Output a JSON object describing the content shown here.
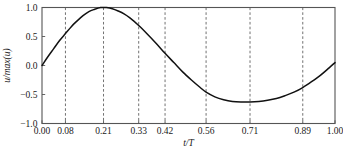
{
  "figure": {
    "background_color": "#ffffff",
    "frame_color": "#555555",
    "curve_color": "#111111",
    "grid_color": "#4d4d4d"
  },
  "chart_data": {
    "type": "line",
    "title": "",
    "xlabel": "t/T",
    "ylabel": "u/max(u)",
    "xlim": [
      0.0,
      1.0
    ],
    "ylim": [
      -1.0,
      1.0
    ],
    "grid": "vertical-dashed",
    "legend": "none",
    "x_ticks": [
      0.0,
      0.08,
      0.21,
      0.33,
      0.42,
      0.56,
      0.71,
      0.89,
      1.0
    ],
    "x_tick_labels": [
      "0.00",
      "0.08",
      "0.21",
      "0.33",
      "0.42",
      "0.56",
      "0.71",
      "0.89",
      "1.00"
    ],
    "y_ticks": [
      -1.0,
      -0.5,
      0.0,
      0.5,
      1.0
    ],
    "y_tick_labels": [
      "-1.0",
      "-0.5",
      "0.0",
      "0.5",
      "1.0"
    ],
    "gridlines_x": [
      0.08,
      0.21,
      0.33,
      0.42,
      0.56,
      0.71,
      0.89
    ],
    "series": [
      {
        "name": "u/max(u)",
        "x": [
          0.0,
          0.02,
          0.04,
          0.06,
          0.08,
          0.1,
          0.12,
          0.14,
          0.16,
          0.18,
          0.2,
          0.21,
          0.22,
          0.24,
          0.26,
          0.28,
          0.3,
          0.33,
          0.36,
          0.39,
          0.42,
          0.45,
          0.48,
          0.51,
          0.54,
          0.56,
          0.59,
          0.62,
          0.65,
          0.68,
          0.71,
          0.74,
          0.77,
          0.8,
          0.83,
          0.86,
          0.89,
          0.92,
          0.95,
          0.98,
          1.0
        ],
        "y": [
          0.0,
          0.15,
          0.29,
          0.43,
          0.55,
          0.67,
          0.77,
          0.86,
          0.93,
          0.97,
          1.0,
          1.0,
          1.0,
          0.98,
          0.94,
          0.89,
          0.82,
          0.69,
          0.54,
          0.38,
          0.21,
          0.05,
          -0.11,
          -0.25,
          -0.38,
          -0.46,
          -0.54,
          -0.59,
          -0.62,
          -0.63,
          -0.63,
          -0.62,
          -0.6,
          -0.57,
          -0.52,
          -0.46,
          -0.38,
          -0.28,
          -0.17,
          -0.04,
          0.05
        ]
      }
    ]
  }
}
